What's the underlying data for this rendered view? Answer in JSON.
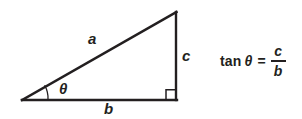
{
  "figure": {
    "background_color": "#ffffff",
    "stroke_color": "#231f20",
    "text_color": "#231f20",
    "width": 302,
    "height": 119
  },
  "triangle": {
    "vertices": {
      "left": {
        "x": 22,
        "y": 100
      },
      "apex": {
        "x": 176,
        "y": 12
      },
      "right_angle": {
        "x": 176,
        "y": 100
      }
    },
    "stroke_width": 2,
    "angle_arc": {
      "center": {
        "x": 22,
        "y": 100
      },
      "radius": 26,
      "stroke_width": 1.2
    },
    "right_angle_marker": {
      "size": 9,
      "stroke_width": 1.4
    }
  },
  "labels": {
    "hypotenuse": "a",
    "base": "b",
    "vertical": "c",
    "angle": "θ"
  },
  "equation": {
    "function_name": "tan",
    "variable": "θ",
    "equals": "=",
    "numerator": "c",
    "denominator": "b",
    "plain_text": "tan θ = c / b"
  }
}
